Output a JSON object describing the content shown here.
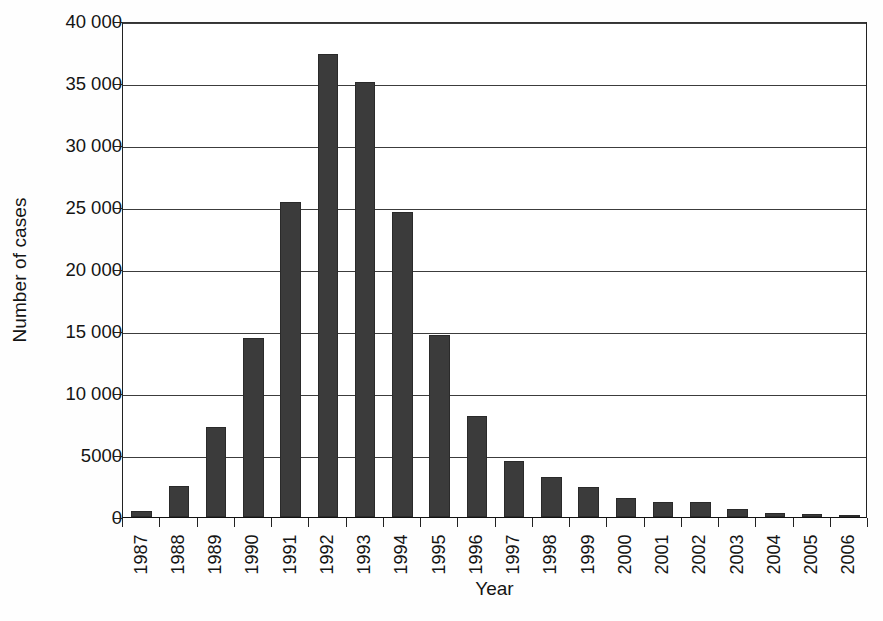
{
  "chart_data": {
    "type": "bar",
    "title": "",
    "xlabel": "Year",
    "ylabel": "Number of cases",
    "categories": [
      "1987",
      "1988",
      "1989",
      "1990",
      "1991",
      "1992",
      "1993",
      "1994",
      "1995",
      "1996",
      "1997",
      "1998",
      "1999",
      "2000",
      "2001",
      "2002",
      "2003",
      "2004",
      "2005",
      "2006"
    ],
    "values": [
      500,
      2500,
      7250,
      14400,
      25400,
      37300,
      35100,
      24600,
      14700,
      8150,
      4500,
      3200,
      2400,
      1500,
      1250,
      1200,
      650,
      350,
      250,
      120
    ],
    "ylim": [
      0,
      40000
    ],
    "ytick_values": [
      0,
      5000,
      10000,
      15000,
      20000,
      25000,
      30000,
      35000,
      40000
    ],
    "ytick_labels": [
      "0",
      "5000",
      "10 000",
      "15 000",
      "20 000",
      "25 000",
      "30 000",
      "35 000",
      "40 000"
    ],
    "grid": true,
    "legend": false,
    "legend_position": "none",
    "bar_color": "#3b3b3b",
    "background_color": "#ffffff",
    "axis_color": "#222222"
  }
}
